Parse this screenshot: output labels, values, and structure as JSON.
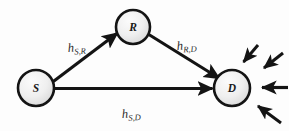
{
  "figure": {
    "kind": "relay-channel-diagram",
    "width": 289,
    "height": 131,
    "background_color": "#fdfdfd",
    "stroke_color": "#141414",
    "node_fill_light": "#f2f2f2",
    "node_fill_dark": "#d8d8d8",
    "label_color": "#2b2b2b"
  },
  "nodes": [
    {
      "id": "S",
      "label": "S",
      "role": "source",
      "cx": 36,
      "cy": 88,
      "r": 18
    },
    {
      "id": "R",
      "label": "R",
      "role": "relay",
      "cx": 133,
      "cy": 27,
      "r": 17
    },
    {
      "id": "D",
      "label": "D",
      "role": "destination",
      "cx": 232,
      "cy": 88,
      "r": 18
    }
  ],
  "edges": [
    {
      "id": "s-r",
      "from": "S",
      "to": "R",
      "label_base": "h",
      "label_sub": "S,R",
      "label_x": 68,
      "label_y": 52
    },
    {
      "id": "r-d",
      "from": "R",
      "to": "D",
      "label_base": "h",
      "label_sub": "R,D",
      "label_x": 177,
      "label_y": 50
    },
    {
      "id": "s-d",
      "from": "S",
      "to": "D",
      "label_base": "h",
      "label_sub": "S,D",
      "label_x": 122,
      "label_y": 118
    }
  ],
  "interference_arrows": [
    {
      "id": "interference-upper-1",
      "target": "D",
      "direction": "from-upper-right"
    },
    {
      "id": "interference-upper-2",
      "target": "D",
      "direction": "from-upper-right-outer"
    },
    {
      "id": "interference-right",
      "target": "D",
      "direction": "from-right"
    },
    {
      "id": "interference-lower",
      "target": "D",
      "direction": "from-lower-right"
    }
  ]
}
